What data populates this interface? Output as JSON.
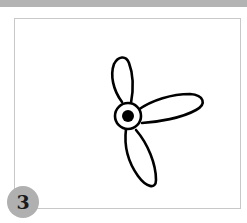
{
  "figure": {
    "step_number": "3",
    "colors": {
      "top_bar": "#b3b3b3",
      "frame_border": "#c8c8c8",
      "badge": "#b0b0b0",
      "stroke": "#000000"
    }
  }
}
